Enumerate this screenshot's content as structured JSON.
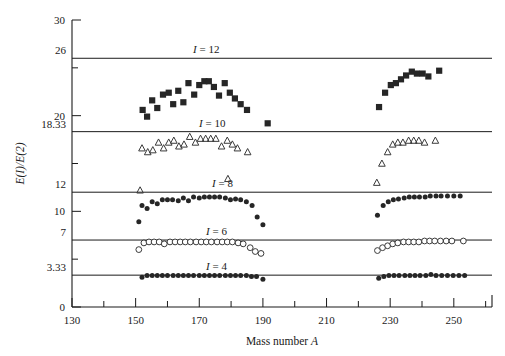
{
  "chart_data": {
    "type": "scatter",
    "title": "",
    "xlabel": "Mass number A",
    "ylabel": "E(I)/E(2)",
    "xlim": [
      130,
      262
    ],
    "ylim": [
      0,
      30
    ],
    "grid": false,
    "legend_position": "inline-right-of-reference-lines",
    "xticks_major": [
      130,
      150,
      170,
      190,
      210,
      230,
      250
    ],
    "xticks_minor": [
      140,
      160,
      180,
      200,
      220,
      240,
      260
    ],
    "yticks_major": [
      0,
      10,
      20,
      30
    ],
    "yticks_minor": [
      5,
      15,
      25
    ],
    "reference_lines": [
      {
        "label": "I = 12",
        "value": 26,
        "value_label": "26",
        "label_x": 193
      },
      {
        "label": "I = 10",
        "value": 18.33,
        "value_label": "18.33",
        "label_x": 199
      },
      {
        "label": "I = 8",
        "value": 12,
        "value_label": "12",
        "label_x": 212
      },
      {
        "label": "I = 6",
        "value": 7,
        "value_label": "7",
        "label_x": 206
      },
      {
        "label": "I = 4",
        "value": 3.33,
        "value_label": "3.33",
        "label_x": 206
      }
    ],
    "series": [
      {
        "name": "I = 12",
        "marker": "filled-square",
        "points": [
          [
            152.2,
            20.6
          ],
          [
            153.6,
            19.9
          ],
          [
            155.2,
            21.6
          ],
          [
            156.8,
            20.8
          ],
          [
            158.6,
            22.2
          ],
          [
            160.4,
            22.4
          ],
          [
            161.8,
            21.2
          ],
          [
            163.4,
            22.6
          ],
          [
            165.0,
            21.4
          ],
          [
            166.6,
            23.4
          ],
          [
            168.4,
            22.2
          ],
          [
            170.0,
            23.2
          ],
          [
            171.6,
            23.6
          ],
          [
            173.0,
            23.6
          ],
          [
            174.6,
            23.0
          ],
          [
            176.2,
            22.1
          ],
          [
            178.0,
            23.4
          ],
          [
            179.6,
            22.4
          ],
          [
            181.2,
            21.8
          ],
          [
            183.0,
            21.2
          ],
          [
            185.0,
            20.6
          ],
          [
            191.5,
            19.2
          ],
          [
            226.5,
            20.9
          ],
          [
            228.4,
            22.4
          ],
          [
            230.2,
            23.2
          ],
          [
            231.8,
            23.4
          ],
          [
            233.4,
            23.8
          ],
          [
            235.0,
            24.2
          ],
          [
            236.8,
            24.6
          ],
          [
            238.4,
            24.4
          ],
          [
            240.2,
            24.4
          ],
          [
            242.0,
            24.1
          ],
          [
            245.4,
            24.7
          ]
        ]
      },
      {
        "name": "I = 10",
        "marker": "open-triangle",
        "points": [
          [
            152.0,
            16.6
          ],
          [
            153.8,
            16.2
          ],
          [
            155.4,
            16.4
          ],
          [
            157.2,
            17.2
          ],
          [
            158.8,
            16.6
          ],
          [
            160.4,
            17.2
          ],
          [
            162.0,
            17.4
          ],
          [
            163.6,
            16.8
          ],
          [
            165.2,
            17.0
          ],
          [
            167.0,
            17.8
          ],
          [
            168.8,
            17.2
          ],
          [
            170.4,
            17.6
          ],
          [
            172.0,
            17.6
          ],
          [
            173.6,
            17.6
          ],
          [
            175.2,
            17.6
          ],
          [
            177.0,
            16.8
          ],
          [
            178.8,
            17.4
          ],
          [
            180.4,
            17.0
          ],
          [
            182.0,
            16.6
          ],
          [
            185.2,
            16.2
          ],
          [
            151.4,
            12.2
          ],
          [
            179.0,
            13.4
          ],
          [
            225.8,
            13.0
          ],
          [
            227.4,
            15.0
          ],
          [
            229.2,
            16.2
          ],
          [
            230.8,
            17.0
          ],
          [
            232.4,
            17.2
          ],
          [
            234.0,
            17.2
          ],
          [
            235.8,
            17.4
          ],
          [
            237.4,
            17.4
          ],
          [
            239.0,
            17.4
          ],
          [
            240.8,
            17.2
          ],
          [
            244.2,
            17.4
          ]
        ]
      },
      {
        "name": "I = 8",
        "marker": "filled-circle",
        "points": [
          [
            152.0,
            10.6
          ],
          [
            153.6,
            10.3
          ],
          [
            155.2,
            11.0
          ],
          [
            156.8,
            10.8
          ],
          [
            158.4,
            11.2
          ],
          [
            160.0,
            11.2
          ],
          [
            161.6,
            11.2
          ],
          [
            163.4,
            11.1
          ],
          [
            165.0,
            11.4
          ],
          [
            166.6,
            11.1
          ],
          [
            168.2,
            11.5
          ],
          [
            170.0,
            11.4
          ],
          [
            171.6,
            11.5
          ],
          [
            173.2,
            11.5
          ],
          [
            174.8,
            11.5
          ],
          [
            176.4,
            11.5
          ],
          [
            178.2,
            11.4
          ],
          [
            179.8,
            11.2
          ],
          [
            181.4,
            11.3
          ],
          [
            183.0,
            11.2
          ],
          [
            184.8,
            11.0
          ],
          [
            186.6,
            10.6
          ],
          [
            151.0,
            8.9
          ],
          [
            188.2,
            9.4
          ],
          [
            190.0,
            8.6
          ],
          [
            226.0,
            9.6
          ],
          [
            227.8,
            10.6
          ],
          [
            229.4,
            11.0
          ],
          [
            231.0,
            11.2
          ],
          [
            232.6,
            11.3
          ],
          [
            234.4,
            11.4
          ],
          [
            236.0,
            11.5
          ],
          [
            237.6,
            11.5
          ],
          [
            239.2,
            11.5
          ],
          [
            241.0,
            11.5
          ],
          [
            242.6,
            11.6
          ],
          [
            244.4,
            11.6
          ],
          [
            246.0,
            11.6
          ],
          [
            248.0,
            11.6
          ],
          [
            250.0,
            11.6
          ],
          [
            252.0,
            11.6
          ]
        ]
      },
      {
        "name": "I = 6",
        "marker": "open-circle",
        "points": [
          [
            152.6,
            6.7
          ],
          [
            154.2,
            6.8
          ],
          [
            155.8,
            6.8
          ],
          [
            157.4,
            6.8
          ],
          [
            159.0,
            6.6
          ],
          [
            160.8,
            6.8
          ],
          [
            162.4,
            6.8
          ],
          [
            164.0,
            6.8
          ],
          [
            165.6,
            6.8
          ],
          [
            167.2,
            6.8
          ],
          [
            169.0,
            6.8
          ],
          [
            170.6,
            6.8
          ],
          [
            172.2,
            6.8
          ],
          [
            173.8,
            6.8
          ],
          [
            175.6,
            6.8
          ],
          [
            177.2,
            6.8
          ],
          [
            178.8,
            6.8
          ],
          [
            180.4,
            6.8
          ],
          [
            182.2,
            6.7
          ],
          [
            183.8,
            6.6
          ],
          [
            151.0,
            6.0
          ],
          [
            186.0,
            6.2
          ],
          [
            187.6,
            5.8
          ],
          [
            189.4,
            5.6
          ],
          [
            226.0,
            5.9
          ],
          [
            227.6,
            6.2
          ],
          [
            229.2,
            6.4
          ],
          [
            230.8,
            6.6
          ],
          [
            232.4,
            6.7
          ],
          [
            234.2,
            6.8
          ],
          [
            235.8,
            6.8
          ],
          [
            237.4,
            6.8
          ],
          [
            239.0,
            6.8
          ],
          [
            240.8,
            6.9
          ],
          [
            242.4,
            6.9
          ],
          [
            244.0,
            6.9
          ],
          [
            245.8,
            6.9
          ],
          [
            247.6,
            6.9
          ],
          [
            249.4,
            6.9
          ],
          [
            253.0,
            6.9
          ]
        ]
      },
      {
        "name": "I = 4",
        "marker": "filled-circle",
        "points": [
          [
            152.0,
            3.1
          ],
          [
            153.6,
            3.3
          ],
          [
            155.2,
            3.3
          ],
          [
            156.8,
            3.3
          ],
          [
            158.4,
            3.3
          ],
          [
            160.0,
            3.3
          ],
          [
            161.8,
            3.3
          ],
          [
            163.4,
            3.3
          ],
          [
            165.0,
            3.3
          ],
          [
            166.6,
            3.3
          ],
          [
            168.2,
            3.3
          ],
          [
            170.0,
            3.3
          ],
          [
            171.6,
            3.3
          ],
          [
            173.2,
            3.3
          ],
          [
            174.8,
            3.3
          ],
          [
            176.4,
            3.3
          ],
          [
            178.2,
            3.3
          ],
          [
            179.8,
            3.3
          ],
          [
            181.4,
            3.3
          ],
          [
            183.0,
            3.3
          ],
          [
            184.8,
            3.3
          ],
          [
            186.4,
            3.2
          ],
          [
            188.0,
            3.2
          ],
          [
            190.0,
            2.9
          ],
          [
            226.4,
            3.0
          ],
          [
            228.0,
            3.2
          ],
          [
            229.6,
            3.3
          ],
          [
            231.2,
            3.3
          ],
          [
            232.8,
            3.3
          ],
          [
            234.6,
            3.3
          ],
          [
            236.2,
            3.3
          ],
          [
            237.8,
            3.3
          ],
          [
            239.4,
            3.3
          ],
          [
            241.2,
            3.3
          ],
          [
            242.8,
            3.4
          ],
          [
            244.4,
            3.3
          ],
          [
            246.2,
            3.3
          ],
          [
            248.0,
            3.3
          ],
          [
            249.8,
            3.3
          ],
          [
            251.6,
            3.3
          ],
          [
            253.4,
            3.3
          ]
        ]
      }
    ]
  },
  "axes": {
    "y_title": "E(I)/E(2)",
    "x_title_prefix": "Mass number",
    "x_title_symbol": "A",
    "x_tick_labels": [
      "130",
      "150",
      "170",
      "190",
      "210",
      "230",
      "250"
    ],
    "y_tick_labels": [
      "0",
      "10",
      "20",
      "30"
    ],
    "y_value_labels": [
      "26",
      "18.33",
      "12",
      "7",
      "3.33"
    ]
  },
  "series_labels": [
    "I = 12",
    "I = 10",
    "I = 8",
    "I = 6",
    "I = 4"
  ],
  "colors": {
    "axis": "#1a1a1a",
    "marker_filled": "#262626",
    "marker_open_stroke": "#3a3a3a",
    "background": "#ffffff"
  }
}
